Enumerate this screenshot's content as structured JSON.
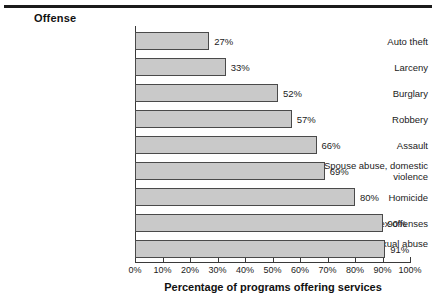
{
  "figure": {
    "legend_title": "Offense",
    "xlabel": "Percentage of programs offering services",
    "bar_fill": "#c9c9c9",
    "bar_stroke": "#4a4a4a",
    "axis_color": "#3a3a3a"
  },
  "chart_data": {
    "type": "bar",
    "orientation": "horizontal",
    "title": "",
    "subtitle": "",
    "xlabel": "Percentage of programs offering services",
    "ylabel": "Offense",
    "categories": [
      "Auto theft",
      "Larceny",
      "Burglary",
      "Robbery",
      "Assault",
      "Spouse abuse, domestic violence",
      "Homicide",
      "Rape, other sex offenses",
      "Child abuse, sexual abuse"
    ],
    "values": [
      27,
      33,
      52,
      57,
      66,
      69,
      80,
      90,
      91
    ],
    "value_labels": [
      "27%",
      "33%",
      "52%",
      "57%",
      "66%",
      "69%",
      "80%",
      "90%",
      "91%"
    ],
    "xlim": [
      0,
      100
    ],
    "xticks": [
      0,
      10,
      20,
      30,
      40,
      50,
      60,
      70,
      80,
      90,
      100
    ],
    "xticklabels": [
      "0%",
      "10%",
      "20%",
      "30%",
      "40%",
      "50%",
      "60%",
      "70%",
      "80%",
      "90%",
      "100%"
    ],
    "grid": false,
    "legend": null,
    "annotations": []
  }
}
